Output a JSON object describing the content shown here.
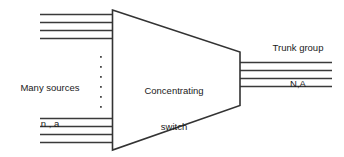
{
  "diagram": {
    "shape": {
      "name": "trapezoid",
      "stroke_color": "#333333",
      "fill_color": "#ffffff",
      "stroke_width": 1.6
    },
    "line_color": "#3a3a3a",
    "labels": {
      "sources": {
        "line1": "Many sources",
        "line2": "n , a"
      },
      "switch": {
        "line1": "Concentrating",
        "line2": "switch"
      },
      "trunk": {
        "line1": "Trunk group",
        "line2": "N,A"
      }
    },
    "input_group_top": {
      "count": 4,
      "label": "top input lines"
    },
    "input_group_bottom": {
      "count": 4,
      "label": "bottom input lines"
    },
    "output_group": {
      "count": 4,
      "label": "trunk output lines"
    },
    "ellipsis": {
      "dot_count": 6,
      "label": "vertical ellipsis between input groups"
    }
  }
}
